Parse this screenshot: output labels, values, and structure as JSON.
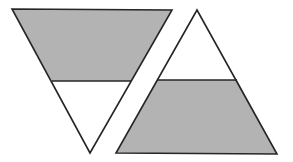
{
  "diagram": {
    "colors": {
      "fill": "#b3b3b3",
      "stroke": "#262626",
      "background": "#ffffff"
    },
    "stroke_width": 1.6,
    "shapes": [
      {
        "name": "inverted-triangle",
        "vertices": [
          [
            12,
            9
          ],
          [
            172,
            10
          ],
          [
            90,
            153
          ]
        ],
        "divider": [
          [
            52,
            81
          ],
          [
            131,
            81
          ]
        ],
        "shaded_region": "top-trapezoid",
        "shaded_points": "12,9 172,10 131,81 52,81",
        "outline_points": "12,9 172,10 90,153"
      },
      {
        "name": "upright-triangle",
        "vertices": [
          [
            197,
            10
          ],
          [
            116,
            153
          ],
          [
            277,
            154
          ]
        ],
        "divider": [
          [
            157,
            80
          ],
          [
            237,
            80
          ]
        ],
        "shaded_region": "bottom-trapezoid",
        "shaded_points": "157,80 237,80 277,154 116,153",
        "outline_points": "197,10 277,154 116,153"
      }
    ]
  }
}
